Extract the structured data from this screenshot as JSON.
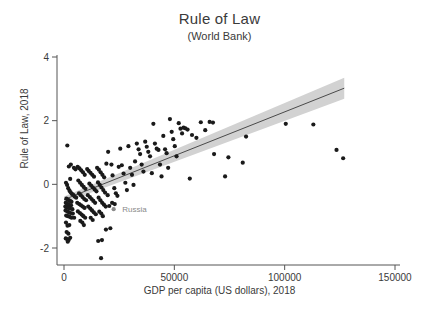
{
  "chart_data": {
    "type": "scatter",
    "title": "Rule of Law",
    "subtitle": "(World Bank)",
    "xlabel": "GDP per capita (US dollars), 2018",
    "ylabel": "Rule of Law, 2018",
    "xlim": [
      0,
      150000
    ],
    "ylim": [
      -2.6,
      4.3
    ],
    "xticks": [
      0,
      50000,
      100000,
      150000
    ],
    "xtick_labels": [
      "0",
      "50000",
      "100000",
      "150000"
    ],
    "yticks": [
      -2,
      0,
      2,
      4
    ],
    "ytick_labels": [
      "-2",
      "0",
      "2",
      "4"
    ],
    "grid": false,
    "legend": "none",
    "point_color": "#1a1a1a",
    "line_color": "#4a4a4a",
    "band_color": "#d2d2d2",
    "axis_color": "#555555",
    "annotation_color": "#8a8a8a",
    "annotations": [
      {
        "label": "Russia",
        "x": 25000,
        "y": -0.78,
        "marker_x": 22500,
        "marker_y": -0.78
      }
    ],
    "fit": {
      "type": "linear",
      "x_start": 0,
      "y_start": -0.48,
      "x_end": 127000,
      "y_end": 3.02,
      "band_half_width_start": 0.1,
      "band_half_width_end": 0.33
    },
    "series": [
      {
        "name": "Countries",
        "points": [
          [
            1500,
            1.22
          ],
          [
            2200,
            0.56
          ],
          [
            3100,
            0.62
          ],
          [
            4500,
            0.52
          ],
          [
            5200,
            0.47
          ],
          [
            2800,
            0.17
          ],
          [
            900,
            0.05
          ],
          [
            1400,
            -0.02
          ],
          [
            1900,
            -0.12
          ],
          [
            2500,
            -0.2
          ],
          [
            3000,
            -0.25
          ],
          [
            3600,
            -0.3
          ],
          [
            4200,
            -0.33
          ],
          [
            4800,
            -0.38
          ],
          [
            5500,
            -0.42
          ],
          [
            1100,
            -0.45
          ],
          [
            1700,
            -0.48
          ],
          [
            2300,
            -0.5
          ],
          [
            2900,
            -0.53
          ],
          [
            3400,
            -0.55
          ],
          [
            800,
            -0.58
          ],
          [
            1300,
            -0.6
          ],
          [
            1800,
            -0.62
          ],
          [
            2400,
            -0.65
          ],
          [
            3200,
            -0.66
          ],
          [
            600,
            -0.7
          ],
          [
            1200,
            -0.72
          ],
          [
            2000,
            -0.74
          ],
          [
            2700,
            -0.76
          ],
          [
            3800,
            -0.78
          ],
          [
            700,
            -0.82
          ],
          [
            1500,
            -0.85
          ],
          [
            2200,
            -0.88
          ],
          [
            3000,
            -0.9
          ],
          [
            4000,
            -0.92
          ],
          [
            1000,
            -0.98
          ],
          [
            1800,
            -1.0
          ],
          [
            2600,
            -1.02
          ],
          [
            3400,
            -1.05
          ],
          [
            4600,
            -1.05
          ],
          [
            900,
            -1.2
          ],
          [
            1600,
            -1.3
          ],
          [
            2400,
            -1.28
          ],
          [
            1200,
            -1.5
          ],
          [
            2000,
            -1.55
          ],
          [
            800,
            -1.7
          ],
          [
            1400,
            -1.72
          ],
          [
            2100,
            -1.75
          ],
          [
            2800,
            -1.68
          ],
          [
            1700,
            -1.8
          ],
          [
            6200,
            0.55
          ],
          [
            7000,
            0.5
          ],
          [
            7800,
            0.44
          ],
          [
            8600,
            0.38
          ],
          [
            9400,
            0.3
          ],
          [
            6500,
            0.12
          ],
          [
            7300,
            0.05
          ],
          [
            8100,
            -0.02
          ],
          [
            8900,
            -0.08
          ],
          [
            9700,
            -0.14
          ],
          [
            6800,
            -0.28
          ],
          [
            7600,
            -0.34
          ],
          [
            8400,
            -0.4
          ],
          [
            9200,
            -0.46
          ],
          [
            10000,
            -0.5
          ],
          [
            6000,
            -0.58
          ],
          [
            6900,
            -0.62
          ],
          [
            7700,
            -0.66
          ],
          [
            8500,
            -0.7
          ],
          [
            9300,
            -0.74
          ],
          [
            6300,
            -0.85
          ],
          [
            7200,
            -0.9
          ],
          [
            8000,
            -0.95
          ],
          [
            8800,
            -1.0
          ],
          [
            9600,
            -1.05
          ],
          [
            7400,
            -1.15
          ],
          [
            8300,
            -1.2
          ],
          [
            9000,
            -1.28
          ],
          [
            10500,
            0.48
          ],
          [
            11200,
            0.42
          ],
          [
            12000,
            0.36
          ],
          [
            12800,
            0.3
          ],
          [
            13600,
            0.24
          ],
          [
            11500,
            0.02
          ],
          [
            12300,
            -0.04
          ],
          [
            13100,
            -0.1
          ],
          [
            13900,
            -0.16
          ],
          [
            14700,
            -0.22
          ],
          [
            10800,
            -0.34
          ],
          [
            11700,
            -0.4
          ],
          [
            12500,
            -0.46
          ],
          [
            13300,
            -0.52
          ],
          [
            14100,
            -0.58
          ],
          [
            11000,
            -0.7
          ],
          [
            11900,
            -0.76
          ],
          [
            12700,
            -0.82
          ],
          [
            13500,
            -0.88
          ],
          [
            14400,
            -0.94
          ],
          [
            12100,
            -1.05
          ],
          [
            13000,
            -1.12
          ],
          [
            15000,
            0.52
          ],
          [
            15800,
            0.46
          ],
          [
            16600,
            0.38
          ],
          [
            17400,
            0.3
          ],
          [
            18200,
            0.22
          ],
          [
            15400,
            0.06
          ],
          [
            16200,
            -0.02
          ],
          [
            17000,
            -0.1
          ],
          [
            17800,
            -0.18
          ],
          [
            18600,
            -0.26
          ],
          [
            15700,
            -0.42
          ],
          [
            16500,
            -0.5
          ],
          [
            17300,
            -0.58
          ],
          [
            18100,
            -0.64
          ],
          [
            18900,
            -0.7
          ],
          [
            16000,
            -0.86
          ],
          [
            16900,
            -0.92
          ],
          [
            17600,
            -1.0
          ],
          [
            19200,
            0.65
          ],
          [
            19800,
            -0.34
          ],
          [
            15500,
            -1.78
          ],
          [
            17200,
            -1.75
          ],
          [
            19000,
            -1.42
          ],
          [
            21000,
            -1.38
          ],
          [
            16800,
            -2.32
          ],
          [
            20000,
            1.02
          ],
          [
            21500,
            0.62
          ],
          [
            22000,
            0.28
          ],
          [
            22800,
            -0.12
          ],
          [
            23500,
            -0.28
          ],
          [
            24200,
            -0.36
          ],
          [
            21800,
            -0.58
          ],
          [
            23000,
            -0.62
          ],
          [
            20500,
            -0.68
          ],
          [
            24800,
            0.55
          ],
          [
            25500,
            1.12
          ],
          [
            26200,
            0.6
          ],
          [
            27000,
            0.34
          ],
          [
            27800,
            0.05
          ],
          [
            28500,
            -0.18
          ],
          [
            29200,
            1.2
          ],
          [
            30000,
            0.52
          ],
          [
            30800,
            0.3
          ],
          [
            31500,
            -0.02
          ],
          [
            32200,
            0.72
          ],
          [
            33000,
            1.28
          ],
          [
            33800,
            1.1
          ],
          [
            34500,
            0.95
          ],
          [
            35200,
            0.62
          ],
          [
            36000,
            0.4
          ],
          [
            36800,
            1.34
          ],
          [
            37500,
            1.18
          ],
          [
            38200,
            1.02
          ],
          [
            39000,
            0.88
          ],
          [
            39800,
            0.35
          ],
          [
            40500,
            1.9
          ],
          [
            41200,
            1.28
          ],
          [
            42000,
            1.12
          ],
          [
            42800,
            1.08
          ],
          [
            43500,
            0.62
          ],
          [
            44200,
            0.25
          ],
          [
            45000,
            1.52
          ],
          [
            45800,
            1.1
          ],
          [
            46500,
            0.98
          ],
          [
            47200,
            0.52
          ],
          [
            48000,
            2.05
          ],
          [
            48800,
            1.65
          ],
          [
            49500,
            1.42
          ],
          [
            50200,
            1.2
          ],
          [
            51000,
            0.88
          ],
          [
            52000,
            1.92
          ],
          [
            52800,
            1.75
          ],
          [
            53500,
            1.6
          ],
          [
            54200,
            1.78
          ],
          [
            55000,
            1.76
          ],
          [
            56000,
            1.72
          ],
          [
            57000,
            0.18
          ],
          [
            58000,
            1.55
          ],
          [
            60000,
            1.46
          ],
          [
            62000,
            1.95
          ],
          [
            64000,
            1.7
          ],
          [
            66000,
            1.96
          ],
          [
            67500,
            1.94
          ],
          [
            68000,
            0.95
          ],
          [
            73000,
            0.25
          ],
          [
            74500,
            0.85
          ],
          [
            81000,
            0.68
          ],
          [
            82500,
            1.5
          ],
          [
            100500,
            1.9
          ],
          [
            113000,
            1.88
          ],
          [
            123500,
            1.08
          ],
          [
            126500,
            0.82
          ]
        ]
      }
    ]
  }
}
